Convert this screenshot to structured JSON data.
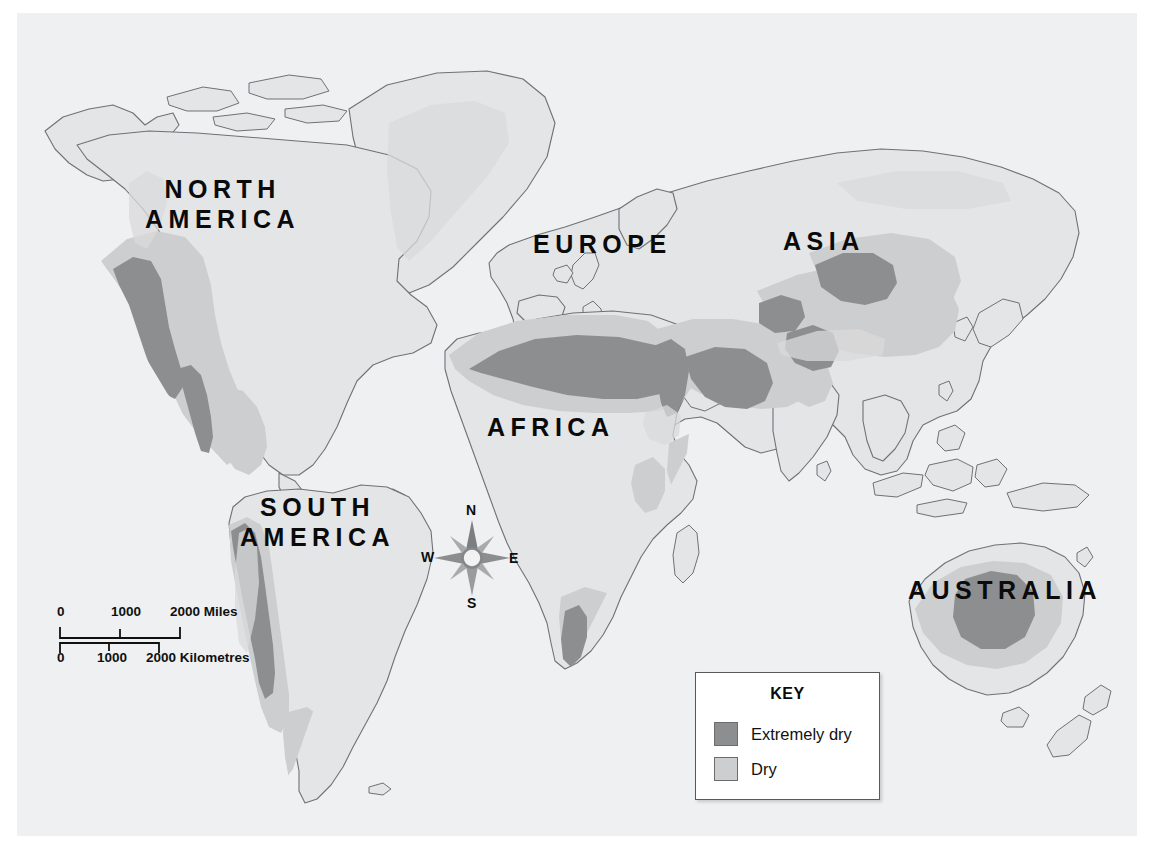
{
  "map": {
    "title": "World map of arid regions",
    "panel_background": "#eff0f1",
    "page_background": "#ffffff",
    "land_fill": "#e4e5e6",
    "land_stroke": "#6f7174",
    "dry_color": "#cdcecf",
    "extremely_dry_color": "#8d8e90"
  },
  "labels": {
    "north_america": "NORTH\nAMERICA",
    "south_america": "SOUTH\nAMERICA",
    "europe": "EUROPE",
    "asia": "ASIA",
    "africa": "AFRICA",
    "australia": "AUSTRALIA"
  },
  "scale_bar": {
    "miles": {
      "ticks": [
        "0",
        "1000",
        "2000 Miles"
      ],
      "unit": "Miles"
    },
    "kilometres": {
      "ticks": [
        "0",
        "1000",
        "2000 Kilometres"
      ],
      "unit": "Kilometres"
    }
  },
  "compass": {
    "north": "N",
    "east": "E",
    "south": "S",
    "west": "W"
  },
  "key": {
    "title": "KEY",
    "entries": [
      {
        "label": "Extremely dry",
        "color": "#8d8e90"
      },
      {
        "label": "Dry",
        "color": "#cdcecf"
      }
    ]
  }
}
